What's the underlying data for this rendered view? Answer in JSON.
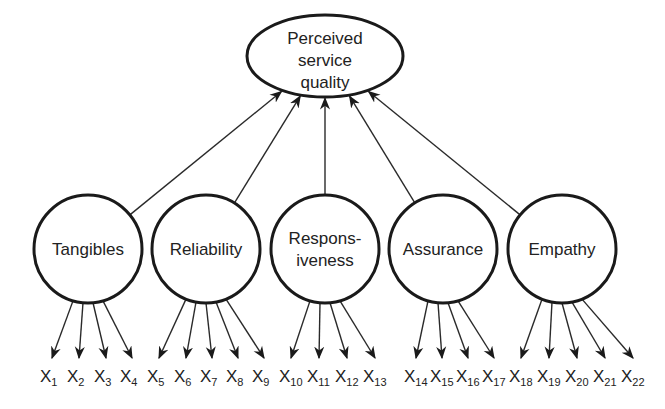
{
  "diagram": {
    "root": {
      "id": "psq",
      "lines": [
        "Perceived",
        "service",
        "quality"
      ]
    },
    "dimensions": [
      {
        "id": "tangibles",
        "lines": [
          "Tangibles"
        ],
        "items": [
          "1",
          "2",
          "3",
          "4"
        ]
      },
      {
        "id": "reliability",
        "lines": [
          "Reliability"
        ],
        "items": [
          "5",
          "6",
          "7",
          "8",
          "9"
        ]
      },
      {
        "id": "responsiveness",
        "lines": [
          "Respons-",
          "iveness"
        ],
        "items": [
          "10",
          "11",
          "12",
          "13"
        ]
      },
      {
        "id": "assurance",
        "lines": [
          "Assurance"
        ],
        "items": [
          "14",
          "15",
          "16",
          "17"
        ]
      },
      {
        "id": "empathy",
        "lines": [
          "Empathy"
        ],
        "items": [
          "18",
          "19",
          "20",
          "21",
          "22"
        ]
      }
    ],
    "item_prefix": "X"
  }
}
